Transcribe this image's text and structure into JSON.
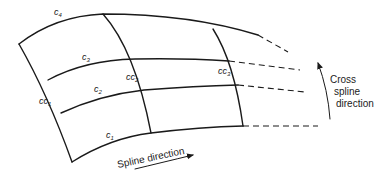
{
  "diagram": {
    "type": "spline-surface-grid",
    "curves": [
      {
        "id": "c1",
        "label": "c",
        "sub": "1"
      },
      {
        "id": "c2",
        "label": "c",
        "sub": "2"
      },
      {
        "id": "c3",
        "label": "c",
        "sub": "3"
      },
      {
        "id": "c4",
        "label": "c",
        "sub": "4"
      }
    ],
    "cross_curves": [
      {
        "id": "cc1",
        "label": "cc",
        "sub": "1"
      },
      {
        "id": "cc2",
        "label": "cc",
        "sub": "2"
      },
      {
        "id": "cc3",
        "label": "cc",
        "sub": "3"
      }
    ],
    "spline_direction_label": "Spline direction",
    "cross_direction_label": {
      "line1": "Cross",
      "line2": "spline",
      "line3": "direction"
    },
    "colors": {
      "stroke": "#1a1a1a",
      "background": "#ffffff"
    }
  }
}
